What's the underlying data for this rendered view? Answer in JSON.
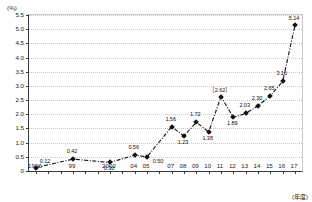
{
  "chart_data": {
    "type": "line",
    "title": "",
    "xlabel": "(年度)",
    "ylabel": "(％)",
    "ylim": [
      0,
      5.5
    ],
    "ytick_labels": [
      "0",
      "0.5",
      "1.0",
      "1.5",
      "2.0",
      "2.5",
      "3.0",
      "3.5",
      "4.0",
      "4.5",
      "5.0",
      "5.5"
    ],
    "ytick_values": [
      0,
      0.5,
      1.0,
      1.5,
      2.0,
      2.5,
      3.0,
      3.5,
      4.0,
      4.5,
      5.0,
      5.5
    ],
    "grid": true,
    "legend": "none",
    "categories": [
      "1996",
      "99",
      "2002",
      "04",
      "05",
      "07",
      "08",
      "09",
      "10",
      "11",
      "12",
      "13",
      "14",
      "15",
      "16",
      "17"
    ],
    "x": [
      1996,
      1999,
      2002,
      2004,
      2005,
      2007,
      2008,
      2009,
      2010,
      2011,
      2012,
      2013,
      2014,
      2015,
      2016,
      2017
    ],
    "values": [
      0.12,
      0.42,
      0.3,
      0.56,
      0.5,
      1.56,
      1.23,
      1.72,
      1.38,
      2.62,
      1.89,
      2.03,
      2.3,
      2.65,
      3.16,
      5.14
    ],
    "point_labels": [
      "0.12",
      "0.42",
      "0.30",
      "0.56",
      "0.50",
      "1.56",
      "1.23",
      "1.72",
      "1.38",
      "［2.62］",
      "1.89",
      "2.03",
      "2.30",
      "2.65",
      "3.16",
      "5.14"
    ],
    "axis_tick_years": [
      1996,
      1997,
      1998,
      1999,
      2000,
      2001,
      2002,
      2003,
      2004,
      2005,
      2006,
      2007,
      2008,
      2009,
      2010,
      2011,
      2012,
      2013,
      2014,
      2015,
      2016,
      2017
    ],
    "line_style": "dash-dot",
    "marker": "diamond",
    "series_color": "#111111",
    "grid_color": "#cfc9bd",
    "axis_color": "#3a3a3a"
  }
}
